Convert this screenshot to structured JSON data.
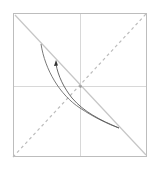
{
  "diagram": {
    "type": "phase-plot",
    "frame": {
      "x": 13,
      "y": 13,
      "width": 133,
      "height": 143,
      "stroke": "#bdbdbd"
    },
    "axes": {
      "center": [
        80,
        86
      ],
      "stroke": "#d8d8d8"
    },
    "solid_diagonal": {
      "from": [
        15,
        15
      ],
      "to": [
        146,
        155
      ],
      "stroke": "#c6c6c6"
    },
    "dashed_diagonal": {
      "from": [
        13,
        157
      ],
      "to": [
        146,
        14
      ],
      "stroke": "#bcbcbc"
    },
    "outer_curve": {
      "start": [
        41,
        44
      ],
      "end": [
        119,
        128
      ],
      "stroke": "#6a6a6a"
    },
    "inner_curve": {
      "start": [
        119,
        128
      ],
      "end": [
        56,
        63
      ],
      "stroke": "#5a5a5a"
    },
    "arrow": {
      "at": [
        56,
        62
      ],
      "direction": "up-left",
      "color": "#333333"
    }
  }
}
